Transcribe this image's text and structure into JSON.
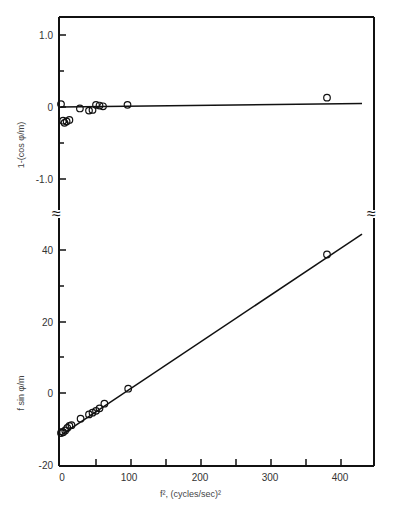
{
  "chart_data": [
    {
      "type": "scatter",
      "panel": "top",
      "title": "",
      "xlabel": "",
      "ylabel": "1-(cos φ/m)",
      "xlim": [
        0,
        450
      ],
      "ylim": [
        -1.3,
        1.3
      ],
      "yticks": [
        1.0,
        0,
        -1.0
      ],
      "ytick_labels": [
        "1.0",
        "0",
        "-1.0"
      ],
      "grid": false,
      "series": [
        {
          "name": "measured",
          "marker": "open-circle",
          "points": [
            [
              0,
              0.04
            ],
            [
              3,
              -0.19
            ],
            [
              5,
              -0.22
            ],
            [
              8,
              -0.2
            ],
            [
              12,
              -0.18
            ],
            [
              27,
              -0.02
            ],
            [
              40,
              -0.05
            ],
            [
              45,
              -0.04
            ],
            [
              50,
              0.03
            ],
            [
              55,
              0.02
            ],
            [
              60,
              0.01
            ],
            [
              95,
              0.03
            ],
            [
              380,
              0.13
            ]
          ]
        },
        {
          "name": "fit",
          "type": "line",
          "points": [
            [
              0,
              0.0
            ],
            [
              430,
              0.05
            ]
          ]
        }
      ]
    },
    {
      "type": "scatter",
      "panel": "bottom",
      "title": "",
      "xlabel": "f², (cycles/sec)²",
      "ylabel": "f sin φ/m",
      "xlim": [
        0,
        450
      ],
      "ylim": [
        -20,
        50
      ],
      "xticks": [
        0,
        100,
        200,
        300,
        400
      ],
      "xtick_labels": [
        "0",
        "100",
        "200",
        "300",
        "400"
      ],
      "yticks": [
        40,
        20,
        0,
        -20
      ],
      "ytick_labels": [
        "40",
        "20",
        "0",
        "-20"
      ],
      "grid": false,
      "series": [
        {
          "name": "measured",
          "marker": "open-circle",
          "points": [
            [
              0,
              -11.2
            ],
            [
              3,
              -11
            ],
            [
              6,
              -10.5
            ],
            [
              9,
              -9.8
            ],
            [
              12,
              -9.2
            ],
            [
              15,
              -9.0
            ],
            [
              28,
              -7.2
            ],
            [
              40,
              -6
            ],
            [
              45,
              -5.5
            ],
            [
              50,
              -5
            ],
            [
              55,
              -4.3
            ],
            [
              62,
              -3
            ],
            [
              96,
              1.2
            ],
            [
              380,
              38.8
            ]
          ]
        },
        {
          "name": "fit",
          "type": "line",
          "points": [
            [
              0,
              -11.8
            ],
            [
              430,
              44.5
            ]
          ]
        }
      ]
    }
  ],
  "labels": {
    "top_ylabel": "1-(cos φ/m)",
    "bottom_ylabel": "f sin φ/m",
    "xlabel": "f², (cycles/sec)²",
    "top_yticks": [
      "1.0",
      "0",
      "-1.0"
    ],
    "bottom_yticks": [
      "40",
      "20",
      "0",
      "-20"
    ],
    "xticks": [
      "0",
      "100",
      "200",
      "300",
      "400"
    ],
    "break_symbol": "≈"
  }
}
